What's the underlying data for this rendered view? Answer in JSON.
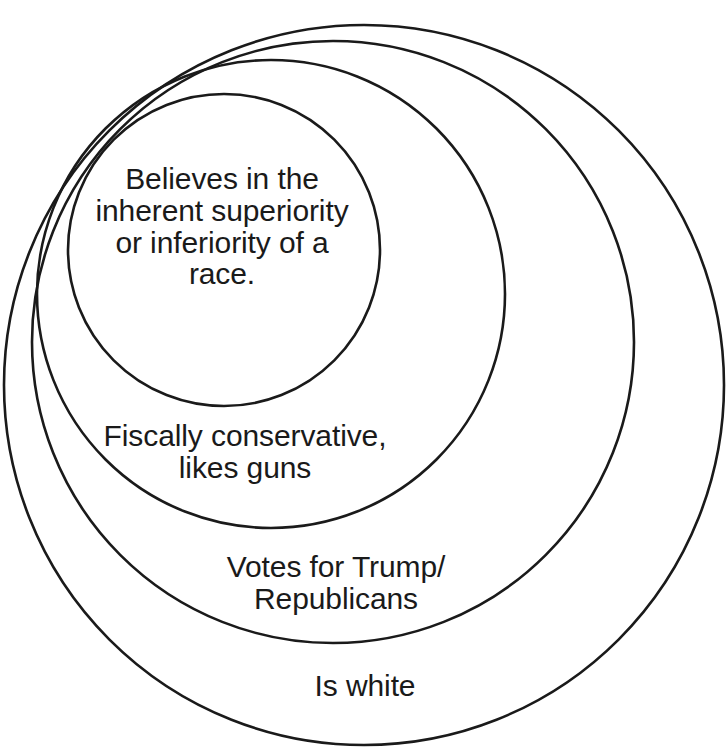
{
  "diagram": {
    "type": "nested-circles-venn",
    "title": "",
    "background_color": "#ffffff",
    "stroke_color": "#1a1a1a",
    "fill_color": "none",
    "tangent_point": {
      "x": 170,
      "y": 100,
      "description": "all circles internally tangent near upper-left"
    },
    "rings": [
      {
        "id": "innermost",
        "order": 1,
        "label": "Believes in the\ninherent superiority\nor inferiority of a\nrace.",
        "lines": [
          "Believes in the",
          "inherent superiority",
          "or inferiority of a",
          "race."
        ],
        "cx": 224,
        "cy": 250,
        "r": 156
      },
      {
        "id": "second",
        "order": 2,
        "label": "Fiscally conservative,\nlikes guns",
        "lines": [
          "Fiscally conservative,",
          "likes guns"
        ],
        "cx": 271,
        "cy": 294,
        "r": 234
      },
      {
        "id": "third",
        "order": 3,
        "label": "Votes for Trump/\nRepublicans",
        "lines": [
          "Votes for Trump/",
          "Republicans"
        ],
        "cx": 333,
        "cy": 342,
        "r": 301
      },
      {
        "id": "outermost",
        "order": 4,
        "label": "Is white",
        "lines": [
          "Is white"
        ],
        "cx": 364,
        "cy": 385,
        "r": 360
      }
    ]
  },
  "chart_data": {
    "type": "diagram",
    "chart_subtype": "nested-euler-diagram",
    "title": "",
    "xlabel": "",
    "ylabel": "",
    "legend_position": "none",
    "grid": false,
    "categories": [
      "Is white",
      "Votes for Trump/Republicans",
      "Fiscally conservative, likes guns",
      "Believes in the inherent superiority or inferiority of a race."
    ],
    "values": [
      360,
      301,
      234,
      156
    ],
    "value_units": "circle radius in pixels",
    "annotations": [
      "Is white",
      "Votes for Trump/ Republicans",
      "Fiscally conservative, likes guns",
      "Believes in the inherent superiority or inferiority of a race."
    ],
    "nesting_order_outer_to_inner": [
      "Is white",
      "Votes for Trump/Republicans",
      "Fiscally conservative, likes guns",
      "Believes in the inherent superiority or inferiority of a race."
    ]
  }
}
